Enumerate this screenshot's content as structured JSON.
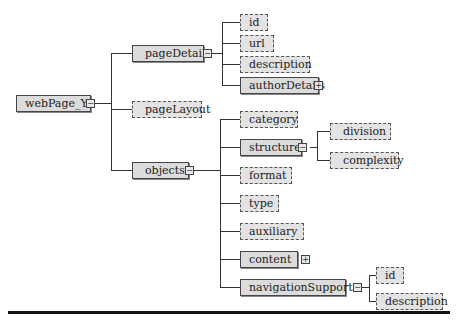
{
  "diagram": {
    "root": {
      "label": "webPage_Y",
      "expander": "−"
    },
    "level1": [
      {
        "label": "pageDetails",
        "style": "solid",
        "expander": "−"
      },
      {
        "label": "pageLayout",
        "style": "dashed"
      },
      {
        "label": "objects",
        "style": "solid",
        "expander": "−"
      }
    ],
    "pageDetails_children": [
      {
        "label": "id",
        "style": "dashed"
      },
      {
        "label": "url",
        "style": "dashed"
      },
      {
        "label": "description",
        "style": "dashed"
      },
      {
        "label": "authorDetails",
        "style": "solid",
        "expander": "+"
      }
    ],
    "objects_children": [
      {
        "label": "category",
        "style": "dashed"
      },
      {
        "label": "structure",
        "style": "solid",
        "expander": "−"
      },
      {
        "label": "format",
        "style": "dashed"
      },
      {
        "label": "type",
        "style": "dashed"
      },
      {
        "label": "auxiliary",
        "style": "dashed"
      },
      {
        "label": "content",
        "style": "solid",
        "expander": "+"
      },
      {
        "label": "navigationSupport",
        "style": "solid",
        "expander": "−"
      }
    ],
    "structure_children": [
      {
        "label": "division",
        "style": "dashed"
      },
      {
        "label": "complexity",
        "style": "dashed"
      }
    ],
    "navigationSupport_children": [
      {
        "label": "id",
        "style": "dashed"
      },
      {
        "label": "description",
        "style": "dashed"
      }
    ]
  }
}
